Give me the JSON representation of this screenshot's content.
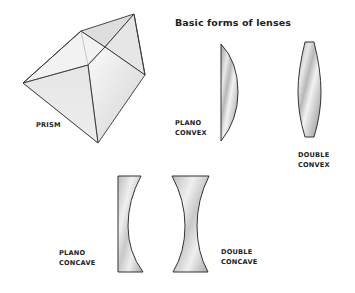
{
  "title": "Basic forms of lenses",
  "shapes": [
    {
      "id": "prism",
      "label_lines": [
        "PRISM"
      ]
    },
    {
      "id": "plano-convex",
      "label_lines": [
        "PLANO",
        "CONVEX"
      ]
    },
    {
      "id": "double-convex",
      "label_lines": [
        "DOUBLE",
        "CONVEX"
      ]
    },
    {
      "id": "plano-concave",
      "label_lines": [
        "PLANO",
        "CONCAVE"
      ]
    },
    {
      "id": "double-concave",
      "label_lines": [
        "DOUBLE",
        "CONCAVE"
      ]
    }
  ],
  "colors": {
    "outline": "#333333",
    "glass_light": "#f4f4f4",
    "glass_mid": "#d6d6d6",
    "glass_dark": "#a9a9a9",
    "text": "#222222"
  }
}
